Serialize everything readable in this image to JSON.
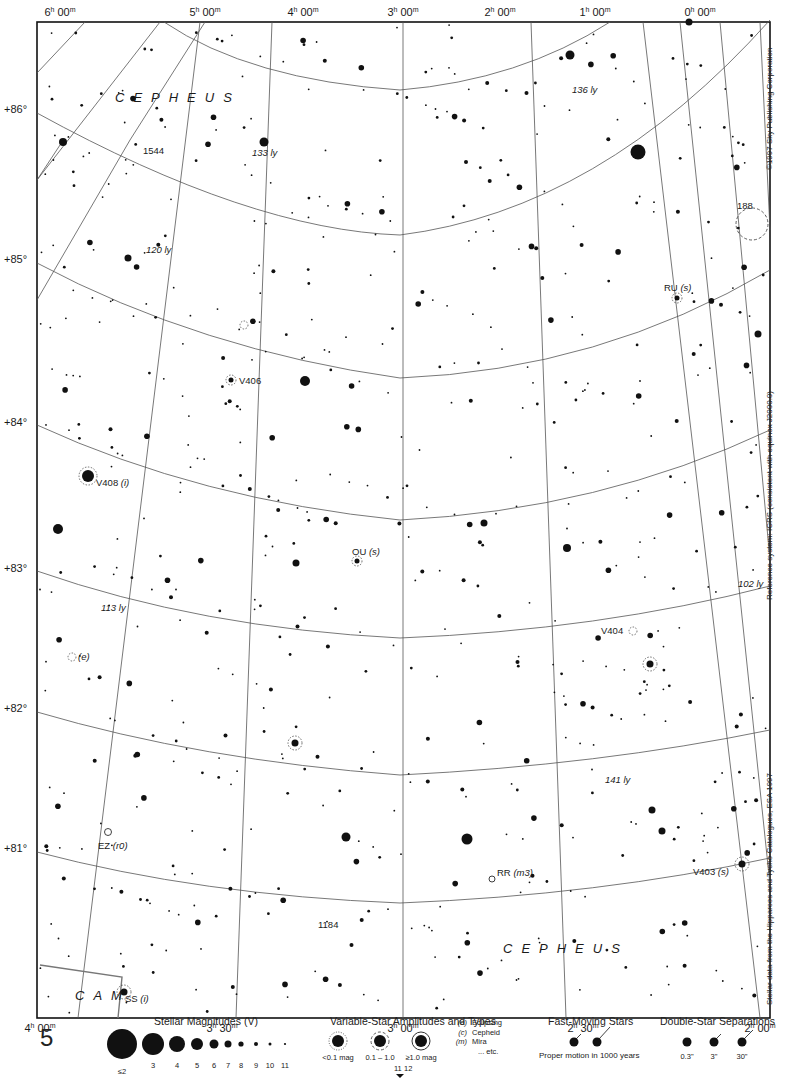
{
  "chart_title": "Sky Atlas Chart 5 — Cepheus / Camelopardalis polar region",
  "page_number": "5",
  "ra_labels_top": [
    {
      "text": "6h 00m",
      "x": 60,
      "y": 16
    },
    {
      "text": "5h 00m",
      "x": 205,
      "y": 16
    },
    {
      "text": "4h 00m",
      "x": 303,
      "y": 16
    },
    {
      "text": "3h 00m",
      "x": 403,
      "y": 16
    },
    {
      "text": "2h 00m",
      "x": 500,
      "y": 16
    },
    {
      "text": "1h 00m",
      "x": 595,
      "y": 16
    },
    {
      "text": "0h 00m",
      "x": 700,
      "y": 16
    }
  ],
  "ra_labels_bottom": [
    {
      "text": "4h 00m",
      "x": 40,
      "y": 1032
    },
    {
      "text": "3h 30m",
      "x": 222,
      "y": 1032
    },
    {
      "text": "3h 00m",
      "x": 403,
      "y": 1032
    },
    {
      "text": "2h 30m",
      "x": 583,
      "y": 1032
    },
    {
      "text": "2h 00m",
      "x": 760,
      "y": 1032
    }
  ],
  "dec_labels": [
    {
      "text": "+86°",
      "y": 113
    },
    {
      "text": "+85°",
      "y": 263
    },
    {
      "text": "+84°",
      "y": 426
    },
    {
      "text": "+83°",
      "y": 572
    },
    {
      "text": "+82°",
      "y": 712
    },
    {
      "text": "+81°",
      "y": 852
    }
  ],
  "constellations": [
    {
      "name": "CEPHEUS",
      "x": 115,
      "y": 102
    },
    {
      "name": "CEPHEUS",
      "x": 503,
      "y": 953
    },
    {
      "name": "CAM",
      "x": 75,
      "y": 1000
    }
  ],
  "annotations": [
    {
      "text": "1544",
      "x": 143,
      "y": 154,
      "style": "normal"
    },
    {
      "text": "133 ly",
      "x": 252,
      "y": 156,
      "style": "italic"
    },
    {
      "text": "136 ly",
      "x": 572,
      "y": 93,
      "style": "italic"
    },
    {
      "text": "120 ly",
      "x": 146,
      "y": 253,
      "style": "italic"
    },
    {
      "text": "188",
      "x": 737,
      "y": 209,
      "style": "normal"
    },
    {
      "text": "RU (s)",
      "x": 664,
      "y": 291,
      "style": "var"
    },
    {
      "text": "V406",
      "x": 239,
      "y": 384,
      "style": "normal"
    },
    {
      "text": "V408 (i)",
      "x": 96,
      "y": 486,
      "style": "var"
    },
    {
      "text": "OU (s)",
      "x": 352,
      "y": 555,
      "style": "var"
    },
    {
      "text": "113 ly",
      "x": 101,
      "y": 611,
      "style": "italic"
    },
    {
      "text": "102 ly",
      "x": 738,
      "y": 587,
      "style": "italic"
    },
    {
      "text": "(e)",
      "x": 78,
      "y": 660,
      "style": "italic"
    },
    {
      "text": "V404",
      "x": 601,
      "y": 634,
      "style": "normal"
    },
    {
      "text": "141 ly",
      "x": 605,
      "y": 783,
      "style": "italic"
    },
    {
      "text": "EZ (r0)",
      "x": 98,
      "y": 849,
      "style": "var"
    },
    {
      "text": "RR (m3)",
      "x": 497,
      "y": 876,
      "style": "var"
    },
    {
      "text": "V403 (s)",
      "x": 693,
      "y": 875,
      "style": "var"
    },
    {
      "text": "1184",
      "x": 318,
      "y": 928,
      "style": "normal"
    },
    {
      "text": "SS (i)",
      "x": 125,
      "y": 1002,
      "style": "var"
    }
  ],
  "side_notes": {
    "copyright": "©1997 Sky Publishing Corporation",
    "reference": "Reference system: ICRS (consistent with equinox J2000.0)",
    "source": "Stellar data from the Hipparcos and Tycho Catalogues, ESA 1997"
  },
  "legend": {
    "magnitudes": {
      "title": "Stellar Magnitudes (V)",
      "items": [
        {
          "label": "≤2",
          "r": 15
        },
        {
          "label": "3",
          "r": 11
        },
        {
          "label": "4",
          "r": 8
        },
        {
          "label": "5",
          "r": 6
        },
        {
          "label": "6",
          "r": 4.5
        },
        {
          "label": "7",
          "r": 3.5
        },
        {
          "label": "8",
          "r": 2.6
        },
        {
          "label": "9",
          "r": 2
        },
        {
          "label": "10",
          "r": 1.5
        },
        {
          "label": "11",
          "r": 1.1
        }
      ]
    },
    "variables": {
      "title": "Variable-Star Amplitudes and Types",
      "items": [
        "<0.1 mag",
        "0.1 – 1.0",
        "≥1.0 mag"
      ],
      "types": [
        {
          "code": "(e)",
          "name": "Eclipsing"
        },
        {
          "code": "(c)",
          "name": "Cepheid"
        },
        {
          "code": "(m)",
          "name": "Mira"
        },
        {
          "code": "",
          "name": "... etc."
        }
      ],
      "range_marker": {
        "low": "11",
        "high": "12"
      }
    },
    "fast_moving": {
      "title": "Fast-Moving Stars",
      "caption": "Proper motion in 1000 years"
    },
    "doubles": {
      "title": "Double-Star Separations",
      "items": [
        "0.3\"",
        "3\"",
        "30\""
      ]
    }
  },
  "colors": {
    "ink": "#111111",
    "grid": "#555555",
    "paper": "#ffffff",
    "boundary": "#777777"
  }
}
